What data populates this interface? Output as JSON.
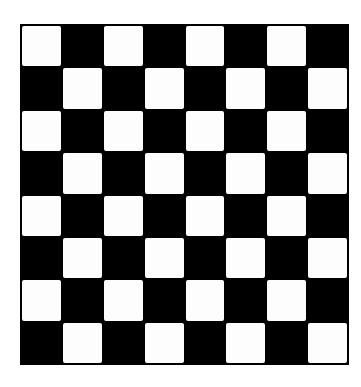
{
  "board": {
    "rows": 8,
    "columns": 8,
    "top_left_color": "light",
    "colors": {
      "light": "#fdfdfd",
      "dark": "#000000",
      "border": "#000000",
      "background": "#ffffff"
    },
    "pattern": [
      [
        "light",
        "dark",
        "light",
        "dark",
        "light",
        "dark",
        "light",
        "dark"
      ],
      [
        "dark",
        "light",
        "dark",
        "light",
        "dark",
        "light",
        "dark",
        "light"
      ],
      [
        "light",
        "dark",
        "light",
        "dark",
        "light",
        "dark",
        "light",
        "dark"
      ],
      [
        "dark",
        "light",
        "dark",
        "light",
        "dark",
        "light",
        "dark",
        "light"
      ],
      [
        "light",
        "dark",
        "light",
        "dark",
        "light",
        "dark",
        "light",
        "dark"
      ],
      [
        "dark",
        "light",
        "dark",
        "light",
        "dark",
        "light",
        "dark",
        "light"
      ],
      [
        "light",
        "dark",
        "light",
        "dark",
        "light",
        "dark",
        "light",
        "dark"
      ],
      [
        "dark",
        "light",
        "dark",
        "light",
        "dark",
        "light",
        "dark",
        "light"
      ]
    ]
  }
}
